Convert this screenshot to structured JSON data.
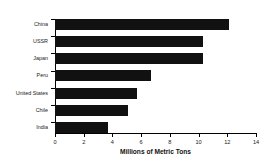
{
  "chart_data": {
    "type": "bar",
    "orientation": "horizontal",
    "title": "",
    "xlabel": "Millions of Metric Tons",
    "ylabel": "",
    "xlim": [
      0,
      14
    ],
    "xticks": [
      0,
      2,
      4,
      6,
      8,
      10,
      12,
      14
    ],
    "grid": false,
    "legend": null,
    "bar_color": "#111111",
    "categories": [
      "China",
      "USSR",
      "Japan",
      "Peru",
      "United States",
      "Chile",
      "India"
    ],
    "values": [
      12.1,
      10.3,
      10.3,
      6.7,
      5.7,
      5.1,
      3.7
    ]
  }
}
